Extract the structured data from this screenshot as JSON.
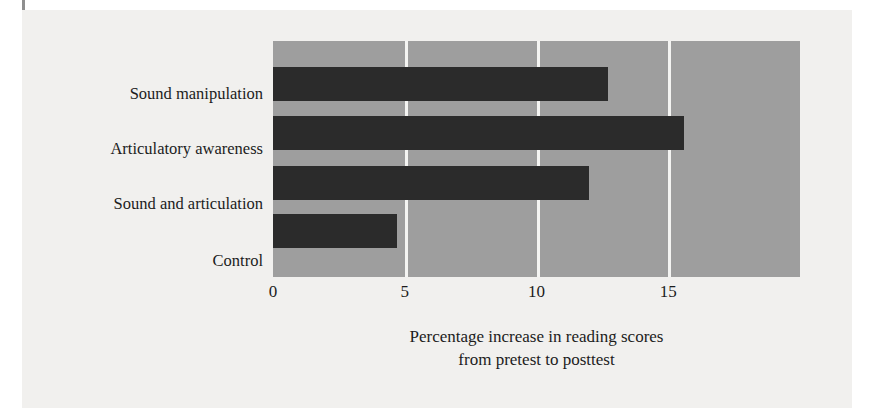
{
  "chart_data": {
    "type": "bar",
    "orientation": "horizontal",
    "title": "",
    "categories": [
      "Sound manipulation",
      "Articulatory awareness",
      "Sound and articulation",
      "Control"
    ],
    "values": [
      12.7,
      15.6,
      12.0,
      4.7
    ],
    "xlabel_lines": [
      "Percentage increase in reading scores",
      "from pretest to posttest"
    ],
    "xlabel": "Percentage increase in reading scores from pretest to posttest",
    "ylabel": "",
    "xlim": [
      0,
      20
    ],
    "xticks": [
      0,
      5,
      10,
      15
    ],
    "xtick_labels": [
      "0",
      "5",
      "10",
      "15"
    ],
    "gridlines": [
      5,
      10,
      15
    ],
    "grid": true,
    "legend": null,
    "colors": {
      "bar": "#2b2b2b",
      "plot_background": "#9e9e9e",
      "gridline": "#f4f4f2",
      "page_background": "#f1f0ee",
      "text": "#1c1c1c"
    }
  }
}
